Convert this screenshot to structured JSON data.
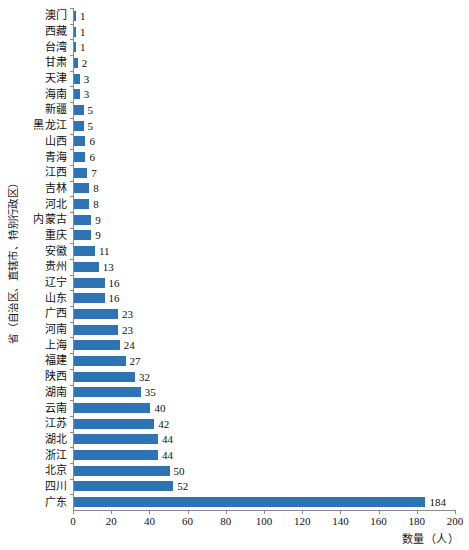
{
  "chart_data": {
    "type": "bar",
    "orientation": "horizontal",
    "title": "",
    "xlabel": "数量（人）",
    "ylabel": "省（自治区、直辖市、特别行政区）",
    "xlim": [
      0,
      200
    ],
    "xticks": [
      0,
      20,
      40,
      60,
      80,
      100,
      120,
      140,
      160,
      180,
      200
    ],
    "grid": false,
    "legend": null,
    "bar_color": "#2e74b5",
    "axis_color": "#8a8a8a",
    "categories": [
      "澳门",
      "西藏",
      "台湾",
      "甘肃",
      "天津",
      "海南",
      "新疆",
      "黑龙江",
      "山西",
      "青海",
      "江西",
      "吉林",
      "河北",
      "内蒙古",
      "重庆",
      "安徽",
      "贵州",
      "辽宁",
      "山东",
      "广西",
      "河南",
      "上海",
      "福建",
      "陕西",
      "湖南",
      "云南",
      "江苏",
      "湖北",
      "浙江",
      "北京",
      "四川",
      "广东"
    ],
    "values": [
      1,
      1,
      1,
      2,
      3,
      3,
      5,
      5,
      6,
      6,
      7,
      8,
      8,
      9,
      9,
      11,
      13,
      16,
      16,
      23,
      23,
      24,
      27,
      32,
      35,
      40,
      42,
      44,
      44,
      50,
      52,
      184
    ],
    "data_labels": [
      "1",
      "1",
      "1",
      "2",
      "3",
      "3",
      "5",
      "5",
      "6",
      "6",
      "7",
      "8",
      "8",
      "9",
      "9",
      "11",
      "13",
      "16",
      "16",
      "23",
      "23",
      "24",
      "27",
      "32",
      "35",
      "40",
      "42",
      "44",
      "44",
      "50",
      "52",
      "184"
    ]
  }
}
